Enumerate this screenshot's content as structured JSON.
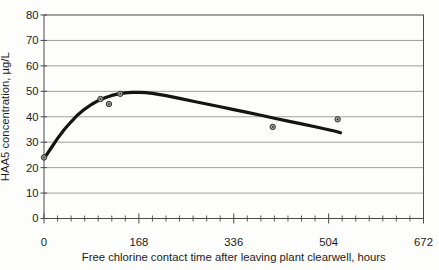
{
  "figure": {
    "width": 439,
    "height": 270,
    "background": "#fdfdfb"
  },
  "colors": {
    "gridline": "#9e9e9e",
    "axis": "#4a4a4a",
    "curve": "#141414",
    "marker_fill": "#a3a3a3",
    "marker_stroke": "#2e2e2e",
    "text": "#1c1c1c"
  },
  "chart_data": {
    "type": "scatter",
    "title": "",
    "xlabel": "Free chlorine contact time after leaving plant clearwell, hours",
    "ylabel": "HAA5 concentration, µg/L",
    "xlim": [
      0,
      672
    ],
    "ylim": [
      0,
      80
    ],
    "x_major_ticks": [
      0,
      168,
      336,
      504,
      672
    ],
    "x_minor_tick_interval": 24,
    "y_ticks": [
      0,
      10,
      20,
      30,
      40,
      50,
      60,
      70,
      80
    ],
    "grid": "horizontal-only",
    "legend": "none",
    "points": [
      {
        "x": 0,
        "y": 24
      },
      {
        "x": 100,
        "y": 47
      },
      {
        "x": 115,
        "y": 45
      },
      {
        "x": 135,
        "y": 49
      },
      {
        "x": 405,
        "y": 36
      },
      {
        "x": 520,
        "y": 39
      }
    ],
    "fit_curve": [
      [
        0,
        23.5
      ],
      [
        12,
        27.5
      ],
      [
        24,
        31.5
      ],
      [
        36,
        35.0
      ],
      [
        48,
        38.0
      ],
      [
        60,
        40.8
      ],
      [
        72,
        43.0
      ],
      [
        84,
        44.8
      ],
      [
        96,
        46.3
      ],
      [
        108,
        47.5
      ],
      [
        120,
        48.4
      ],
      [
        132,
        49.0
      ],
      [
        144,
        49.4
      ],
      [
        156,
        49.6
      ],
      [
        168,
        49.6
      ],
      [
        180,
        49.5
      ],
      [
        192,
        49.2
      ],
      [
        216,
        48.3
      ],
      [
        240,
        47.2
      ],
      [
        264,
        46.1
      ],
      [
        288,
        45.0
      ],
      [
        312,
        43.9
      ],
      [
        336,
        42.8
      ],
      [
        360,
        41.7
      ],
      [
        384,
        40.6
      ],
      [
        408,
        39.4
      ],
      [
        432,
        38.3
      ],
      [
        456,
        37.2
      ],
      [
        480,
        36.1
      ],
      [
        504,
        34.9
      ],
      [
        516,
        34.3
      ],
      [
        525,
        33.7
      ]
    ]
  }
}
